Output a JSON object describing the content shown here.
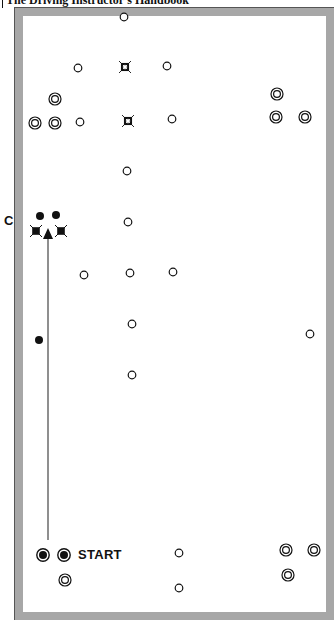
{
  "header": {
    "title": "The Driving Instructor's Handbook"
  },
  "labels": {
    "c": "C",
    "start": "START"
  },
  "colors": {
    "frame": "#a7a7a7",
    "ink": "#111111",
    "paper": "#ffffff"
  },
  "markers": {
    "cones": [
      [
        124,
        17
      ],
      [
        78,
        68
      ],
      [
        167,
        66
      ],
      [
        80,
        122
      ],
      [
        172,
        119
      ],
      [
        127,
        171
      ],
      [
        128,
        222
      ],
      [
        84,
        275
      ],
      [
        130,
        273
      ],
      [
        173,
        272
      ],
      [
        132,
        324
      ],
      [
        132,
        375
      ],
      [
        310,
        334
      ],
      [
        179,
        553
      ],
      [
        179,
        588
      ]
    ],
    "open_crosses": [
      [
        125,
        67
      ],
      [
        128,
        121
      ]
    ],
    "double_circles": [
      [
        55,
        99
      ],
      [
        35,
        123
      ],
      [
        55,
        123
      ],
      [
        277,
        94
      ],
      [
        276,
        117
      ],
      [
        305,
        117
      ],
      [
        286,
        550
      ],
      [
        314,
        550
      ],
      [
        288,
        575
      ],
      [
        65,
        580
      ]
    ],
    "filled_dots": [
      [
        40,
        216
      ],
      [
        56,
        215
      ],
      [
        39,
        340
      ]
    ],
    "filled_crosses": [
      [
        36,
        231
      ],
      [
        61,
        231
      ]
    ],
    "start_markers": [
      [
        43,
        555
      ],
      [
        64,
        555
      ]
    ]
  },
  "arrow": {
    "x": 48,
    "y_start": 540,
    "y_end": 228
  }
}
